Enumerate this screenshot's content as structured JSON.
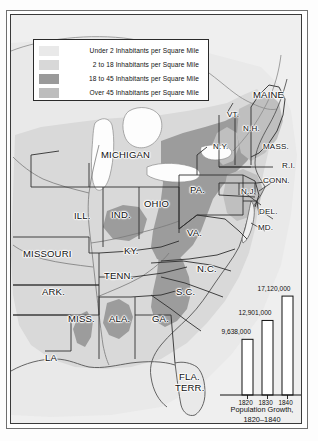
{
  "map": {
    "title": "Population Density of the United States, 1820-1840",
    "legend": {
      "name": "density-legend",
      "items": [
        {
          "swatch": "#e9e9e9",
          "label": "Under 2 Inhabitants per Square Mile"
        },
        {
          "swatch": "#d8d8d8",
          "label": "2 to 18 Inhabitants per Square Mile"
        },
        {
          "swatch": "#9a9a9a",
          "label": "18 to 45 Inhabitants per Square Mile"
        },
        {
          "swatch": "#bdbdbd",
          "label": "Over 45 Inhabitants per Square Mile"
        }
      ]
    },
    "state_labels": [
      {
        "id": "maine",
        "text": "MAINE",
        "x": 252,
        "y": 88,
        "size": "lg"
      },
      {
        "id": "vermont",
        "text": "VT.",
        "x": 226,
        "y": 109,
        "size": "md"
      },
      {
        "id": "new-hampshire",
        "text": "N.H.",
        "x": 242,
        "y": 123,
        "size": "md"
      },
      {
        "id": "massachusetts",
        "text": "MASS.",
        "x": 262,
        "y": 141,
        "size": "md"
      },
      {
        "id": "rhode-island",
        "text": "R.I.",
        "x": 281,
        "y": 160,
        "size": "md"
      },
      {
        "id": "connecticut",
        "text": "CONN.",
        "x": 262,
        "y": 175,
        "size": "md"
      },
      {
        "id": "new-york",
        "text": "N.Y.",
        "x": 212,
        "y": 141,
        "size": "md"
      },
      {
        "id": "pennsylvania",
        "text": "PA.",
        "x": 189,
        "y": 183,
        "size": "lg"
      },
      {
        "id": "new-jersey",
        "text": "N.J.",
        "x": 240,
        "y": 186,
        "size": "md"
      },
      {
        "id": "delaware",
        "text": "DEL.",
        "x": 258,
        "y": 206,
        "size": "md"
      },
      {
        "id": "maryland",
        "text": "MD.",
        "x": 257,
        "y": 222,
        "size": "md"
      },
      {
        "id": "virginia",
        "text": "VA.",
        "x": 186,
        "y": 226,
        "size": "lg"
      },
      {
        "id": "michigan",
        "text": "MICHIGAN",
        "x": 100,
        "y": 148,
        "size": "lg"
      },
      {
        "id": "ohio",
        "text": "OHIO",
        "x": 143,
        "y": 197,
        "size": "lg"
      },
      {
        "id": "indiana",
        "text": "IND.",
        "x": 110,
        "y": 208,
        "size": "lg"
      },
      {
        "id": "illinois",
        "text": "ILL.",
        "x": 73,
        "y": 209,
        "size": "lg"
      },
      {
        "id": "missouri",
        "text": "MISSOURI",
        "x": 22,
        "y": 247,
        "size": "lg"
      },
      {
        "id": "kentucky",
        "text": "KY.",
        "x": 123,
        "y": 244,
        "size": "lg"
      },
      {
        "id": "tennessee",
        "text": "TENN.",
        "x": 103,
        "y": 269,
        "size": "lg"
      },
      {
        "id": "arkansas",
        "text": "ARK.",
        "x": 41,
        "y": 285,
        "size": "lg"
      },
      {
        "id": "mississippi",
        "text": "MISS.",
        "x": 67,
        "y": 312,
        "size": "lg"
      },
      {
        "id": "alabama",
        "text": "ALA.",
        "x": 108,
        "y": 312,
        "size": "lg"
      },
      {
        "id": "georgia",
        "text": "GA.",
        "x": 151,
        "y": 312,
        "size": "lg"
      },
      {
        "id": "south-carolina",
        "text": "S.C.",
        "x": 175,
        "y": 285,
        "size": "lg"
      },
      {
        "id": "north-carolina",
        "text": "N.C.",
        "x": 196,
        "y": 262,
        "size": "lg"
      },
      {
        "id": "louisiana",
        "text": "LA",
        "x": 44,
        "y": 351,
        "size": "lg"
      },
      {
        "id": "florida-territory-line1",
        "text": "FLA.",
        "x": 178,
        "y": 370,
        "size": "lg"
      },
      {
        "id": "florida-territory-line2",
        "text": "TERR.",
        "x": 174,
        "y": 381,
        "size": "lg"
      }
    ]
  },
  "chart_data": {
    "type": "bar",
    "title": "Population Growth,",
    "subtitle": "1820–1840",
    "categories": [
      "1820",
      "1830",
      "1840"
    ],
    "values": [
      9638000,
      12901000,
      17120000
    ],
    "value_labels": [
      "9,638,000",
      "12,901,000",
      "17,120,000"
    ],
    "xlabel": "",
    "ylabel": "",
    "ylim": [
      0,
      18000000
    ],
    "grid": false,
    "legend": "none",
    "bar_fill": "#ffffff",
    "bar_stroke": "#111111"
  }
}
